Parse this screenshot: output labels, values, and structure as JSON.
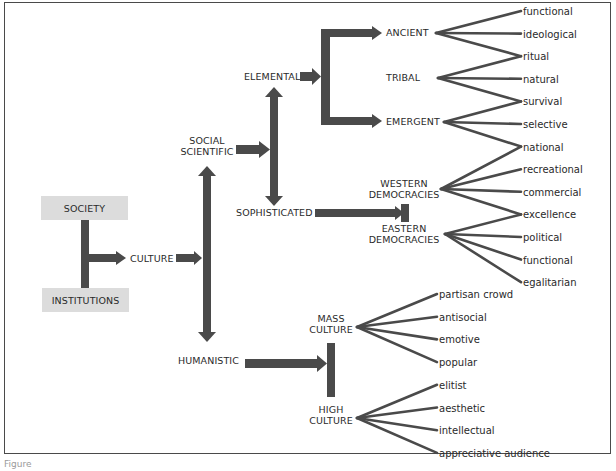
{
  "diagram": {
    "colors": {
      "arrow": "#4a4a4a",
      "box_fill": "#dcdcdc",
      "line": "#4a4a4a",
      "text": "#2a2a2a",
      "border": "#4a4a4a"
    },
    "root": {
      "top_box": "SOCIETY",
      "bottom_box": "INSTITUTIONS",
      "center": "CULTURE"
    },
    "branches": {
      "upper": "SOCIAL SCIENTIFIC",
      "upper_lines": [
        "SOCIAL",
        "SCIENTIFIC"
      ],
      "lower": "HUMANISTIC"
    },
    "social_scientific": {
      "upper": "ELEMENTAL",
      "lower": "SOPHISTICATED"
    },
    "elemental": {
      "nodes": [
        {
          "label": "ANCIENT",
          "leaves": [
            "functional",
            "ideological",
            "ritual"
          ]
        },
        {
          "label": "TRIBAL",
          "leaves": [
            "ritual",
            "natural",
            "survival"
          ]
        },
        {
          "label": "EMERGENT",
          "leaves": [
            "survival",
            "selective",
            "national"
          ]
        }
      ]
    },
    "sophisticated": {
      "nodes": [
        {
          "label": "WESTERN DEMOCRACIES",
          "lines": [
            "WESTERN",
            "DEMOCRACIES"
          ],
          "leaves": [
            "national",
            "recreational",
            "commercial",
            "excellence"
          ]
        },
        {
          "label": "EASTERN DEMOCRACIES",
          "lines": [
            "EASTERN",
            "DEMOCRACIES"
          ],
          "leaves": [
            "excellence",
            "political",
            "functional",
            "egalitarian"
          ]
        }
      ]
    },
    "humanistic": {
      "nodes": [
        {
          "label": "MASS CULTURE",
          "lines": [
            "MASS",
            "CULTURE"
          ],
          "leaves": [
            "partisan crowd",
            "antisocial",
            "emotive",
            "popular"
          ]
        },
        {
          "label": "HIGH CULTURE",
          "lines": [
            "HIGH",
            "CULTURE"
          ],
          "leaves": [
            "elitist",
            "aesthetic",
            "intellectual",
            "appreciative audience"
          ]
        }
      ]
    },
    "leaf_column_upper": [
      "functional",
      "ideological",
      "ritual",
      "natural",
      "survival",
      "selective",
      "national",
      "recreational",
      "commercial",
      "excellence",
      "political",
      "functional",
      "egalitarian"
    ],
    "leaf_column_lower": [
      "partisan crowd",
      "antisocial",
      "emotive",
      "popular",
      "elitist",
      "aesthetic",
      "intellectual",
      "appreciative audience"
    ]
  },
  "caption": "Figure"
}
